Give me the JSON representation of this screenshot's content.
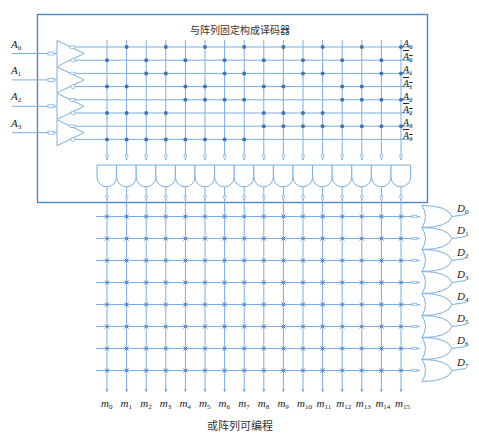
{
  "title": "与阵列固定构成译码器",
  "caption": "或阵列可编程",
  "colors": {
    "frame": "#4a86c8",
    "line": "#7aaee0",
    "dot": "#3f74b3",
    "gate": "#7aaee0",
    "text": "#222222"
  },
  "inputs": [
    {
      "name": "A",
      "sub": "0"
    },
    {
      "name": "A",
      "sub": "1"
    },
    {
      "name": "A",
      "sub": "2"
    },
    {
      "name": "A",
      "sub": "3"
    }
  ],
  "and_rows": [
    {
      "label": "A",
      "sub": "0",
      "inverted": false
    },
    {
      "label": "A",
      "sub": "0",
      "inverted": true
    },
    {
      "label": "A",
      "sub": "1",
      "inverted": false
    },
    {
      "label": "A",
      "sub": "1",
      "inverted": true
    },
    {
      "label": "A",
      "sub": "2",
      "inverted": false
    },
    {
      "label": "A",
      "sub": "2",
      "inverted": true
    },
    {
      "label": "A",
      "sub": "3",
      "inverted": false
    },
    {
      "label": "A",
      "sub": "3",
      "inverted": true
    }
  ],
  "minterms": [
    "0",
    "1",
    "2",
    "3",
    "4",
    "5",
    "6",
    "7",
    "8",
    "9",
    "10",
    "11",
    "12",
    "13",
    "14",
    "15"
  ],
  "outputs": [
    {
      "name": "D",
      "sub": "0"
    },
    {
      "name": "D",
      "sub": "1"
    },
    {
      "name": "D",
      "sub": "2"
    },
    {
      "name": "D",
      "sub": "3"
    },
    {
      "name": "D",
      "sub": "4"
    },
    {
      "name": "D",
      "sub": "5"
    },
    {
      "name": "D",
      "sub": "6"
    },
    {
      "name": "D",
      "sub": "7"
    }
  ],
  "and_array_note": "Fixed AND array: minterm m_i connects to A_k if bit k of i is 1, otherwise to complement of A_k",
  "or_array_note": "Programmable OR array: every intersection marked with a programmable cross"
}
